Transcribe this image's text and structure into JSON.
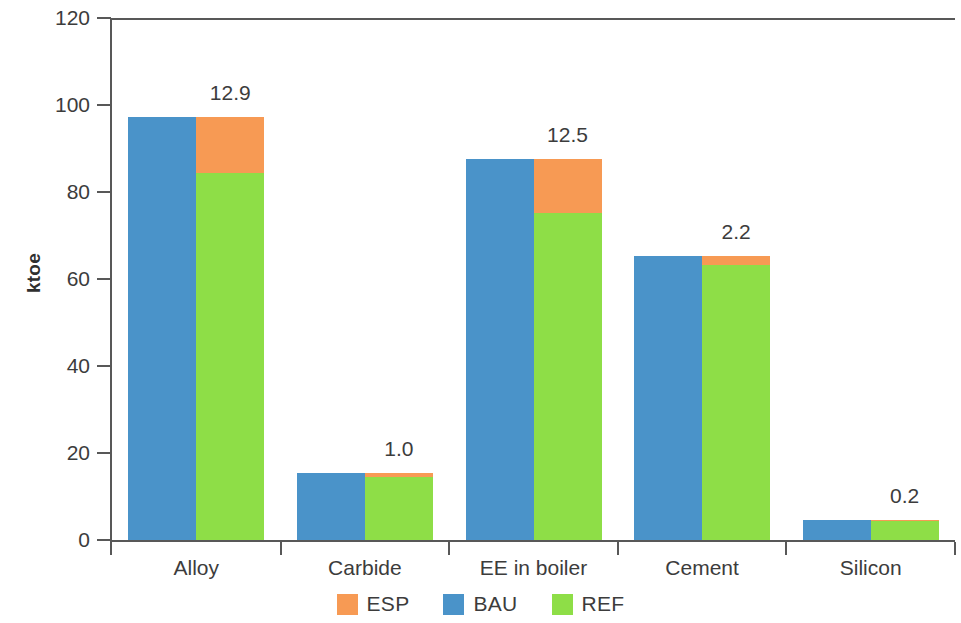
{
  "chart_data": {
    "type": "bar",
    "subtype": "grouped-stacked",
    "title": "",
    "xlabel": "",
    "ylabel": "ktoe",
    "ylim": [
      0,
      120
    ],
    "yticks": [
      0,
      20,
      40,
      60,
      80,
      100,
      120
    ],
    "ytick_labels": [
      "0",
      "20",
      "40",
      "60",
      "80",
      "100",
      "120"
    ],
    "grid": false,
    "legend_position": "bottom-center",
    "categories": [
      "Alloy",
      "Carbide",
      "EE in boiler",
      "Cement",
      "Silicon"
    ],
    "series": [
      {
        "name": "BAU",
        "color": "#4a93c9",
        "values": [
          97.3,
          15.5,
          87.6,
          65.4,
          4.5
        ]
      },
      {
        "name": "REF",
        "color": "#8ede47",
        "values": [
          84.4,
          14.5,
          75.1,
          63.2,
          4.3
        ]
      },
      {
        "name": "ESP",
        "color": "#f79a54",
        "values": [
          12.9,
          1.0,
          12.5,
          2.2,
          0.2
        ]
      }
    ],
    "data_labels": [
      "12.9",
      "1.0",
      "12.5",
      "2.2",
      "0.2"
    ],
    "legend": [
      {
        "label": "ESP",
        "color": "#f79a54"
      },
      {
        "label": "BAU",
        "color": "#4a93c9"
      },
      {
        "label": "REF",
        "color": "#8ede47"
      }
    ],
    "colors": {
      "esp": "#f79a54",
      "bau": "#4a93c9",
      "ref": "#8ede47",
      "axis": "#585858",
      "text": "#3c3c3c",
      "background": "#ffffff"
    }
  }
}
